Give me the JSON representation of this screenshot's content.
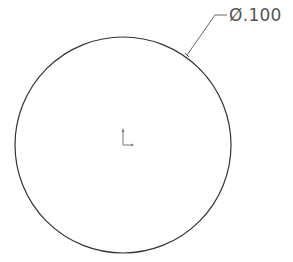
{
  "drawing": {
    "dimension": {
      "label": "Ø.100",
      "symbol": "diameter",
      "value": ".100"
    },
    "circle": {
      "cx": 123,
      "cy": 145,
      "r": 108,
      "stroke": "#333333"
    },
    "leader": {
      "color": "#555555"
    },
    "origin_marker": "origin-axes-icon"
  }
}
